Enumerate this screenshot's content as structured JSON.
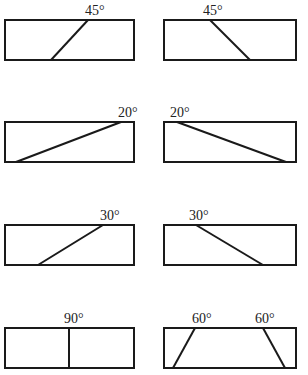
{
  "diagram": {
    "stroke_color": "#1a1a1a",
    "panels": [
      {
        "row": 1,
        "side": "left",
        "label": "45°",
        "cuts": [
          {
            "top_x": 88,
            "bottom_x": 51
          }
        ]
      },
      {
        "row": 1,
        "side": "right",
        "label": "45°",
        "cuts": [
          {
            "top_x": 210,
            "bottom_x": 250
          }
        ]
      },
      {
        "row": 2,
        "side": "left",
        "label": "20°",
        "cuts": [
          {
            "top_x": 121,
            "bottom_x": 16
          }
        ]
      },
      {
        "row": 2,
        "side": "right",
        "label": "20°",
        "cuts": [
          {
            "top_x": 177,
            "bottom_x": 286
          }
        ]
      },
      {
        "row": 3,
        "side": "left",
        "label": "30°",
        "cuts": [
          {
            "top_x": 103,
            "bottom_x": 38
          }
        ]
      },
      {
        "row": 3,
        "side": "right",
        "label": "30°",
        "cuts": [
          {
            "top_x": 196,
            "bottom_x": 263
          }
        ]
      },
      {
        "row": 4,
        "side": "left",
        "label": "90°",
        "cuts": [
          {
            "top_x": 69,
            "bottom_x": 69
          }
        ]
      },
      {
        "row": 4,
        "side": "right",
        "labels": [
          "60°",
          "60°"
        ],
        "cuts": [
          {
            "top_x": 195,
            "bottom_x": 173
          },
          {
            "top_x": 263,
            "bottom_x": 285
          }
        ]
      }
    ]
  }
}
